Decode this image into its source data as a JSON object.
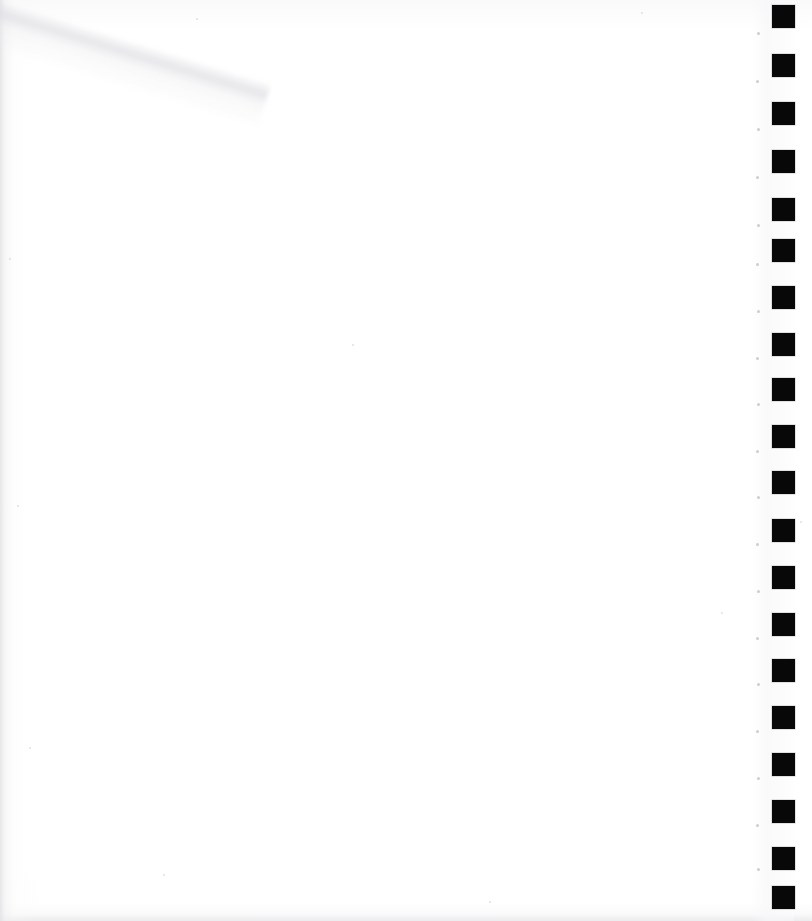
{
  "page": {
    "label": "Scanned blank page",
    "width_px": 812,
    "height_px": 921,
    "background_color": "#ffffff",
    "content_text": ""
  },
  "register_strip": {
    "label": "Register mark strip",
    "description": "Vertical column of solid black square register marks along the right edge",
    "mark_color": "#080808",
    "mark_size_px": 23,
    "column_left_px": 772,
    "first_mark_top_px": 5,
    "pitch_px": 48.5,
    "mark_count": 19,
    "marks": [
      {
        "name": "register-mark-1",
        "top": 5
      },
      {
        "name": "register-mark-2",
        "top": 54
      },
      {
        "name": "register-mark-3",
        "top": 102
      },
      {
        "name": "register-mark-4",
        "top": 150
      },
      {
        "name": "register-mark-5",
        "top": 198
      },
      {
        "name": "register-mark-6",
        "top": 239
      },
      {
        "name": "register-mark-7",
        "top": 286
      },
      {
        "name": "register-mark-8",
        "top": 333
      },
      {
        "name": "register-mark-9",
        "top": 378
      },
      {
        "name": "register-mark-10",
        "top": 425
      },
      {
        "name": "register-mark-11",
        "top": 471
      },
      {
        "name": "register-mark-12",
        "top": 519
      },
      {
        "name": "register-mark-13",
        "top": 566
      },
      {
        "name": "register-mark-14",
        "top": 613
      },
      {
        "name": "register-mark-15",
        "top": 659
      },
      {
        "name": "register-mark-16",
        "top": 706
      },
      {
        "name": "register-mark-17",
        "top": 753
      },
      {
        "name": "register-mark-18",
        "top": 800
      },
      {
        "name": "register-mark-19",
        "top": 847
      },
      {
        "name": "register-mark-20",
        "top": 886
      }
    ],
    "guide_dots": [
      {
        "name": "guide-dot-1",
        "top": 32,
        "left": 757,
        "size": 3
      },
      {
        "name": "guide-dot-2",
        "top": 80,
        "left": 756,
        "size": 3
      },
      {
        "name": "guide-dot-3",
        "top": 128,
        "left": 757,
        "size": 3
      },
      {
        "name": "guide-dot-4",
        "top": 176,
        "left": 756,
        "size": 3
      },
      {
        "name": "guide-dot-5",
        "top": 224,
        "left": 757,
        "size": 3
      },
      {
        "name": "guide-dot-6",
        "top": 263,
        "left": 756,
        "size": 3
      },
      {
        "name": "guide-dot-7",
        "top": 310,
        "left": 757,
        "size": 3
      },
      {
        "name": "guide-dot-8",
        "top": 357,
        "left": 756,
        "size": 3
      },
      {
        "name": "guide-dot-9",
        "top": 403,
        "left": 757,
        "size": 3
      },
      {
        "name": "guide-dot-10",
        "top": 450,
        "left": 756,
        "size": 3
      },
      {
        "name": "guide-dot-11",
        "top": 496,
        "left": 757,
        "size": 3
      },
      {
        "name": "guide-dot-12",
        "top": 543,
        "left": 756,
        "size": 3
      },
      {
        "name": "guide-dot-13",
        "top": 590,
        "left": 757,
        "size": 3
      },
      {
        "name": "guide-dot-14",
        "top": 637,
        "left": 756,
        "size": 3
      },
      {
        "name": "guide-dot-15",
        "top": 683,
        "left": 757,
        "size": 3
      },
      {
        "name": "guide-dot-16",
        "top": 730,
        "left": 756,
        "size": 3
      },
      {
        "name": "guide-dot-17",
        "top": 777,
        "left": 757,
        "size": 3
      },
      {
        "name": "guide-dot-18",
        "top": 824,
        "left": 756,
        "size": 3
      },
      {
        "name": "guide-dot-19",
        "top": 868,
        "left": 757,
        "size": 3
      }
    ]
  },
  "scan_artifacts": {
    "label": "Scan artifacts",
    "corner_crease": {
      "name": "corner-crease",
      "position": "top-left",
      "color": "#dfdfe3"
    },
    "edge_shading_color": "#e2e2e4",
    "specks": [
      {
        "top": 18,
        "left": 196,
        "size": 2
      },
      {
        "top": 12,
        "left": 641,
        "size": 2
      },
      {
        "top": 258,
        "left": 9,
        "size": 2
      },
      {
        "top": 344,
        "left": 352,
        "size": 2
      },
      {
        "top": 505,
        "left": 17,
        "size": 2
      },
      {
        "top": 521,
        "left": 800,
        "size": 2
      },
      {
        "top": 612,
        "left": 721,
        "size": 2
      },
      {
        "top": 747,
        "left": 29,
        "size": 2
      },
      {
        "top": 874,
        "left": 163,
        "size": 2
      },
      {
        "top": 901,
        "left": 489,
        "size": 2
      }
    ]
  }
}
